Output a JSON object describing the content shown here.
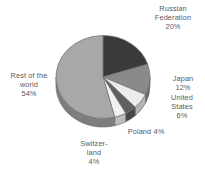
{
  "chart_data": {
    "type": "pie",
    "title": "",
    "subtitle": "",
    "xlabel": "",
    "ylabel": "",
    "grid": false,
    "legend_position": "none",
    "labels_position": "outside-radial",
    "three_d": true,
    "start_angle_deg": 0,
    "direction": "clockwise",
    "categories": [
      "Russian Federation",
      "Japan",
      "United States",
      "Poland",
      "Switzerland",
      "Rest of the world"
    ],
    "values": [
      20,
      12,
      6,
      4,
      4,
      54
    ],
    "value_unit": "%",
    "colors": [
      "#3a3a3a",
      "#8a8a8a",
      "#ebebeb",
      "#606060",
      "#f2f2f2",
      "#a8a8a8"
    ],
    "slices": [
      {
        "name": "Russian Federation",
        "value": 20,
        "value_text": "20%",
        "color": "#3a3a3a",
        "side_color": "#242424"
      },
      {
        "name": "Japan",
        "value": 12,
        "value_text": "12%",
        "color": "#8a8a8a",
        "side_color": "#656565"
      },
      {
        "name": "United States",
        "value": 6,
        "value_text": "6%",
        "color": "#ebebeb",
        "side_color": "#b4b4b4"
      },
      {
        "name": "Poland",
        "value": 4,
        "value_text": "4%",
        "color": "#606060",
        "side_color": "#464646"
      },
      {
        "name": "Switzerland",
        "value": 4,
        "value_text": "4%",
        "color": "#f2f2f2",
        "side_color": "#bdbdbd"
      },
      {
        "name": "Rest of the world",
        "value": 54,
        "value_text": "54%",
        "color": "#a8a8a8",
        "side_color": "#7e7e7e"
      }
    ]
  },
  "labels": {
    "russian_federation": "Russian\nFederation\n20%",
    "japan": "Japan\n12%",
    "united_states": "United\nStates\n6%",
    "poland": "Poland   4%",
    "switzerland": "Switzer-\nland\n4%",
    "rest_of_the_world": "Rest of the\nworld\n54%"
  },
  "style": {
    "background": "#ffffff",
    "label_color": "#5a5a5a",
    "outline_color": "#6e6e6e"
  }
}
